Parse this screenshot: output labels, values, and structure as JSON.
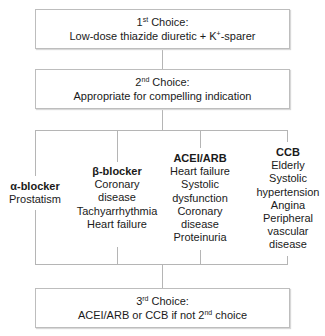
{
  "first_choice": {
    "ordinal": "1",
    "suffix": "st",
    "label": " Choice:",
    "text": "Low-dose thiazide diuretic + K",
    "sup": "+",
    "text_after": "-sparer"
  },
  "second_choice": {
    "ordinal": "2",
    "suffix": "nd",
    "label": " Choice:",
    "text": "Appropriate for compelling indication"
  },
  "branches": [
    {
      "head": "α-blocker",
      "items": [
        "Prostatism"
      ]
    },
    {
      "head": "β-blocker",
      "items": [
        "Coronary",
        "disease",
        "Tachyarrhythmia",
        "Heart failure"
      ]
    },
    {
      "head": "ACEI/ARB",
      "items": [
        "Heart failure",
        "Systolic",
        "dysfunction",
        "Coronary",
        "disease",
        "Proteinuria"
      ]
    },
    {
      "head": "CCB",
      "items": [
        "Elderly",
        "Systolic",
        "hypertension",
        "Angina",
        "Peripheral",
        "vascular",
        "disease"
      ]
    }
  ],
  "third_choice": {
    "ordinal": "3",
    "suffix": "rd",
    "label": " Choice:",
    "text": "ACEI/ARB or CCB if not 2",
    "sup": "nd",
    "text_after": " choice"
  },
  "colors": {
    "border": "#bdbdbd",
    "line": "#b5b5b5",
    "text": "#1a1a1a"
  }
}
